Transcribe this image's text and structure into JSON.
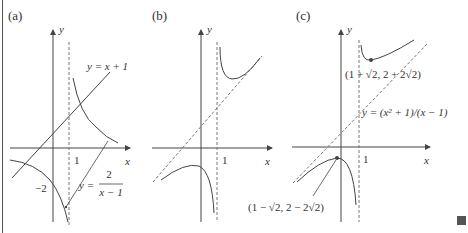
{
  "figure": {
    "colors": {
      "curve": "#444444",
      "axis": "#444444",
      "dashed": "#777777",
      "text": "#333333",
      "end_mark": "#555555"
    },
    "panels": [
      {
        "label": "(a)",
        "axis_x": "x",
        "axis_y": "y",
        "tick_x": "1",
        "tick_y": "−2",
        "line_label": "y = x + 1",
        "curve_label_prefix": "y =",
        "curve_label_num": "2",
        "curve_label_den": "x − 1"
      },
      {
        "label": "(b)",
        "axis_x": "x",
        "axis_y": "y",
        "tick_x": "1"
      },
      {
        "label": "(c)",
        "axis_x": "x",
        "axis_y": "y",
        "tick_x": "1",
        "min_point_label": "(1 + √2, 2 + 2√2)",
        "max_point_label": "(1 − √2, 2 − 2√2)",
        "curve_label": "y = (x² + 1)/(x − 1)"
      }
    ]
  }
}
